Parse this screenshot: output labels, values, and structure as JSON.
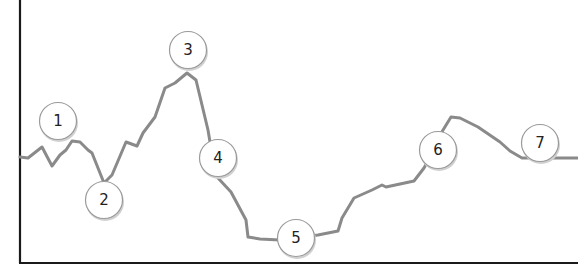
{
  "diagram": {
    "type": "annotated-line-trend",
    "axes": {
      "y_axis": true,
      "x_axis": true,
      "tick_labels": false
    },
    "line_color": "#8a8a8a",
    "axis_color": "#1a1a1a",
    "curve_points": [
      [
        20,
        157
      ],
      [
        28,
        158
      ],
      [
        42,
        147
      ],
      [
        52,
        166
      ],
      [
        60,
        155
      ],
      [
        66,
        150
      ],
      [
        72,
        141
      ],
      [
        80,
        142
      ],
      [
        88,
        150
      ],
      [
        92,
        153
      ],
      [
        104,
        183
      ],
      [
        112,
        175
      ],
      [
        126,
        142
      ],
      [
        137,
        146
      ],
      [
        143,
        133
      ],
      [
        155,
        117
      ],
      [
        165,
        88
      ],
      [
        175,
        83
      ],
      [
        187,
        73
      ],
      [
        196,
        80
      ],
      [
        208,
        130
      ],
      [
        210,
        142
      ],
      [
        218,
        178
      ],
      [
        231,
        192
      ],
      [
        246,
        220
      ],
      [
        248,
        237
      ],
      [
        260,
        239
      ],
      [
        280,
        240
      ],
      [
        318,
        235
      ],
      [
        338,
        231
      ],
      [
        342,
        218
      ],
      [
        354,
        198
      ],
      [
        372,
        190
      ],
      [
        382,
        185
      ],
      [
        386,
        187
      ],
      [
        414,
        181
      ],
      [
        424,
        168
      ],
      [
        434,
        150
      ],
      [
        440,
        135
      ],
      [
        451,
        117
      ],
      [
        460,
        118
      ],
      [
        478,
        127
      ],
      [
        500,
        142
      ],
      [
        510,
        151
      ],
      [
        522,
        158
      ],
      [
        578,
        158
      ]
    ],
    "markers": [
      {
        "label": "1",
        "cx": 58,
        "cy": 121
      },
      {
        "label": "2",
        "cx": 104,
        "cy": 200
      },
      {
        "label": "3",
        "cx": 188,
        "cy": 50
      },
      {
        "label": "4",
        "cx": 218,
        "cy": 158
      },
      {
        "label": "5",
        "cx": 296,
        "cy": 238
      },
      {
        "label": "6",
        "cx": 438,
        "cy": 150
      },
      {
        "label": "7",
        "cx": 540,
        "cy": 143
      }
    ]
  }
}
